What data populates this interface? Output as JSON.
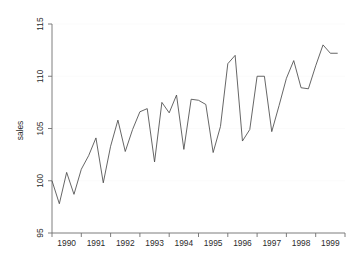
{
  "chart_data": {
    "type": "line",
    "title": "",
    "subtitle": "",
    "xlabel": "",
    "ylabel": "sales",
    "ylim": [
      95,
      115
    ],
    "yticks": [
      95,
      100,
      105,
      110,
      115
    ],
    "ytick_labels": [
      "95",
      "100",
      "105",
      "110",
      "115"
    ],
    "xlim": [
      "1990q1",
      "1999q4"
    ],
    "xtick_labels": [
      "1990",
      "1991",
      "1992",
      "1993",
      "1994",
      "1995",
      "1996",
      "1997",
      "1998",
      "1999"
    ],
    "grid": "faint-horizontal",
    "legend": "none",
    "legend_position": "none",
    "series_color": "#4a4a4a",
    "axis_color": "#6f6f6f",
    "background": "#ffffff",
    "x": [
      "1990q1",
      "1990q2",
      "1990q3",
      "1990q4",
      "1991q1",
      "1991q2",
      "1991q3",
      "1991q4",
      "1992q1",
      "1992q2",
      "1992q3",
      "1992q4",
      "1993q1",
      "1993q2",
      "1993q3",
      "1993q4",
      "1994q1",
      "1994q2",
      "1994q3",
      "1994q4",
      "1995q1",
      "1995q2",
      "1995q3",
      "1995q4",
      "1996q1",
      "1996q2",
      "1996q3",
      "1996q4",
      "1997q1",
      "1997q2",
      "1997q3",
      "1997q4",
      "1998q1",
      "1998q2",
      "1998q3",
      "1998q4",
      "1999q1",
      "1999q2",
      "1999q3",
      "1999q4"
    ],
    "values": [
      100.0,
      97.8,
      100.8,
      98.7,
      101.1,
      102.4,
      104.1,
      99.8,
      103.3,
      105.8,
      102.8,
      104.9,
      106.6,
      106.9,
      101.8,
      107.5,
      106.5,
      108.2,
      103.0,
      107.8,
      107.7,
      107.3,
      102.7,
      105.2,
      111.2,
      112.0,
      103.8,
      104.9,
      110.0,
      110.0,
      104.7,
      107.2,
      109.8,
      111.5,
      108.9,
      108.8,
      111.0,
      113.0,
      112.2,
      112.2
    ],
    "series": [
      {
        "name": "sales",
        "values": [
          100.0,
          97.8,
          100.8,
          98.7,
          101.1,
          102.4,
          104.1,
          99.8,
          103.3,
          105.8,
          102.8,
          104.9,
          106.6,
          106.9,
          101.8,
          107.5,
          106.5,
          108.2,
          103.0,
          107.8,
          107.7,
          107.3,
          102.7,
          105.2,
          111.2,
          112.0,
          103.8,
          104.9,
          110.0,
          110.0,
          104.7,
          107.2,
          109.8,
          111.5,
          108.9,
          108.8,
          111.0,
          113.0,
          112.2,
          112.2
        ]
      }
    ]
  }
}
